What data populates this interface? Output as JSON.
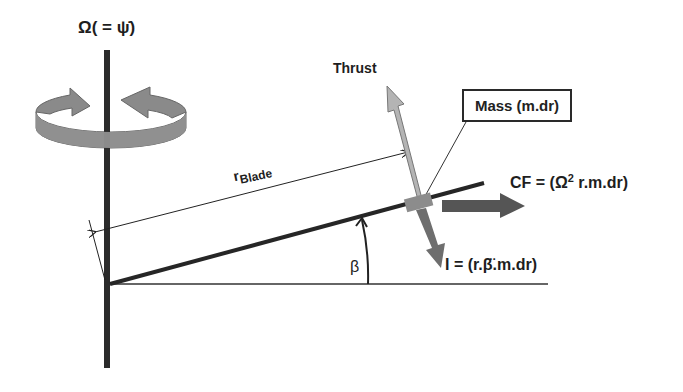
{
  "diagram": {
    "labels": {
      "rotation_rate": "Ω( = ψ̇)",
      "thrust": "Thrust",
      "mass": "Mass (m.dr)",
      "centrifugal_force_prefix": "CF = (Ω",
      "centrifugal_force_exp": "2",
      "centrifugal_force_suffix": " r.m.dr)",
      "inertia": "I = (r.β̈.m.dr)",
      "blade_radius_main": "r",
      "blade_radius_sub": "Blade",
      "flap_angle": "β"
    },
    "colors": {
      "shaft": "#2b2b2b",
      "blade": "#262626",
      "rotation_arrow": "#8a8a8a",
      "thrust_arrow": "#b4b4b4",
      "cf_arrow": "#555555",
      "inertia_arrow": "#6e6e6e",
      "mass_element": "#8c8c8c",
      "text": "#1e1e1e"
    }
  }
}
